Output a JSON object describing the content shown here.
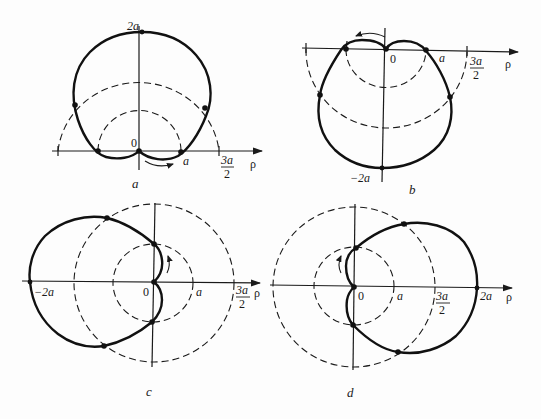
{
  "figure": {
    "panels": [
      {
        "id": "a",
        "caption": "a",
        "curve": "cardioid rho = a(1 + sin phi)",
        "labels": {
          "origin": "0",
          "a": "a",
          "three_halves_num": "3a",
          "three_halves_den": "2",
          "top": "2a",
          "rho": "ρ"
        },
        "rotation_arrow": "counterclockwise-right"
      },
      {
        "id": "b",
        "caption": "b",
        "curve": "cardioid rho = a(1 - sin phi)",
        "labels": {
          "origin": "0",
          "a": "a",
          "three_halves_num": "3a",
          "three_halves_den": "2",
          "bottom": "−2a",
          "rho": "ρ"
        },
        "rotation_arrow": "left"
      },
      {
        "id": "c",
        "caption": "c",
        "curve": "cardioid rho = a(1 - cos phi)",
        "labels": {
          "origin": "0",
          "a": "a",
          "three_halves_num": "3a",
          "three_halves_den": "2",
          "left": "−2a",
          "rho": "ρ"
        },
        "rotation_arrow": "up"
      },
      {
        "id": "d",
        "caption": "d",
        "curve": "cardioid rho = a(1 + cos phi)",
        "labels": {
          "origin": "0",
          "a": "a",
          "three_halves_num": "3a",
          "three_halves_den": "2",
          "right": "2a",
          "rho": "ρ"
        },
        "rotation_arrow": "up"
      }
    ],
    "reference_circles": {
      "inner_radius": "a",
      "outer_radius": "3a/2"
    }
  }
}
